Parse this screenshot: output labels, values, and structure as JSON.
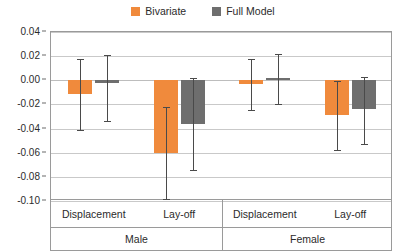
{
  "chart_data": {
    "type": "bar",
    "title": "",
    "subtitle": "",
    "xlabel": "",
    "ylabel": "",
    "ylim": [
      -0.1,
      0.04
    ],
    "ytick_labels": [
      "0.04",
      "0.02",
      "0.00",
      "-0.02",
      "-0.04",
      "-0.06",
      "-0.08",
      "-0.10"
    ],
    "ytick_values": [
      0.04,
      0.02,
      0.0,
      -0.02,
      -0.04,
      -0.06,
      -0.08,
      -0.1
    ],
    "grid": true,
    "legend_position": "top-center",
    "groups": [
      "Male",
      "Female"
    ],
    "categories": [
      "Displacement",
      "Lay-off",
      "Displacement",
      "Lay-off"
    ],
    "category_groups": [
      "Male",
      "Male",
      "Female",
      "Female"
    ],
    "series": [
      {
        "name": "Bivariate",
        "color": "#F08A3C",
        "values": [
          -0.011,
          -0.06,
          -0.003,
          -0.029
        ],
        "ci_upper": [
          0.018,
          -0.022,
          0.018,
          -0.001
        ],
        "ci_lower": [
          -0.041,
          -0.098,
          -0.025,
          -0.058
        ]
      },
      {
        "name": "Full Model",
        "color": "#6E6E6E",
        "values": [
          -0.002,
          -0.036,
          0.002,
          -0.024
        ],
        "ci_upper": [
          0.021,
          0.002,
          0.022,
          0.003
        ],
        "ci_lower": [
          -0.034,
          -0.074,
          -0.02,
          -0.053
        ]
      }
    ]
  },
  "legend": {
    "items": [
      {
        "label": "Bivariate",
        "color": "#F08A3C",
        "swatch_name": "legend-swatch-bivariate"
      },
      {
        "label": "Full Model",
        "color": "#6E6E6E",
        "swatch_name": "legend-swatch-full-model"
      }
    ]
  },
  "axis": {
    "y_ticks": [
      "0.04",
      "0.02",
      "0.00",
      "-0.02",
      "-0.04",
      "-0.06",
      "-0.08",
      "-0.10"
    ]
  },
  "categories_row": [
    "Displacement",
    "Lay-off",
    "Displacement",
    "Lay-off"
  ],
  "groups_row": [
    "Male",
    "Female"
  ]
}
